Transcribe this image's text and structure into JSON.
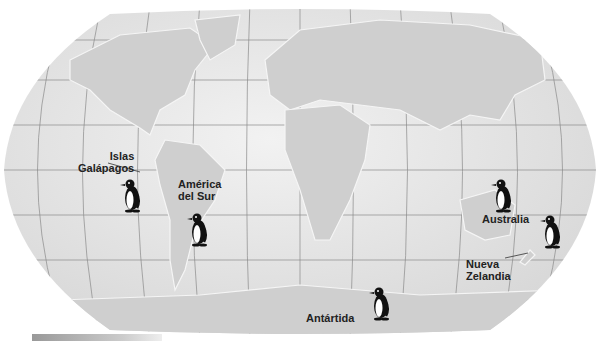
{
  "map": {
    "title": "Penguin distribution world map",
    "labels": {
      "galapagos": "Islas\nGalápagos",
      "galapagos_line1": "Islas",
      "galapagos_line2": "Galápagos",
      "south_america_line1": "América",
      "south_america_line2": "del Sur",
      "australia": "Australia",
      "new_zealand_line1": "Nueva",
      "new_zealand_line2": "Zelandia",
      "antarctica": "Antártida"
    },
    "colors": {
      "ocean": "#e6e6e6",
      "land": "#cfcfcf",
      "grid": "#8a8a8a",
      "text": "#222222"
    },
    "penguin_markers": [
      "galapagos",
      "south-america",
      "australia",
      "new-zealand",
      "antarctica"
    ]
  }
}
